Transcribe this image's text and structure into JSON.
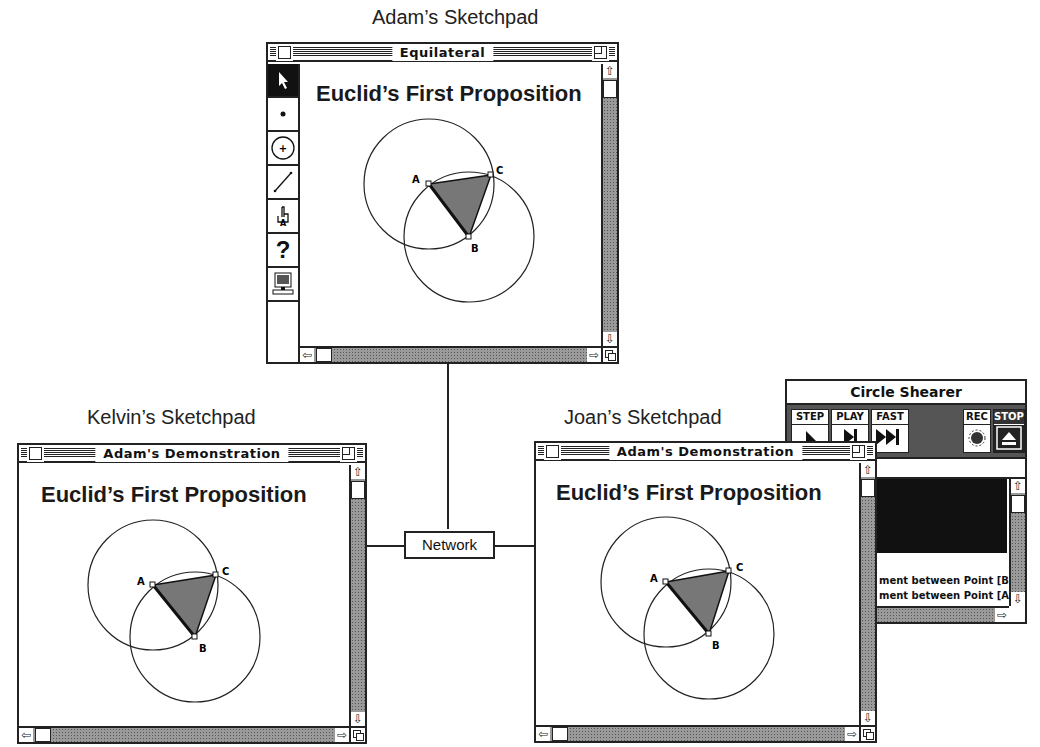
{
  "captions": {
    "adam": "Adam’s Sketchpad",
    "kelvin": "Kelvin’s Sketchpad",
    "joan": "Joan’s Sketchpad"
  },
  "network": {
    "label": "Network"
  },
  "adam_window": {
    "title": "Equilateral",
    "doc_title": "Euclid’s First Proposition",
    "tools": [
      "arrow-select-tool",
      "point-tool",
      "compass-tool",
      "straightedge-tool",
      "text-hand-tool",
      "help-tool",
      "script-tool"
    ]
  },
  "kelvin_window": {
    "title": "Adam's Demonstration",
    "doc_title": "Euclid’s First Proposition"
  },
  "joan_window": {
    "title": "Adam's Demonstration",
    "doc_title": "Euclid’s First Proposition"
  },
  "construction": {
    "points": {
      "A": "A",
      "B": "B",
      "C": "C"
    }
  },
  "script_window": {
    "title": "Circle Shearer",
    "buttons": {
      "step": "STEP",
      "play": "PLAY",
      "fast": "FAST",
      "rec": "REC",
      "stop": "STOP"
    },
    "log_lines": [
      "ment between Point [B",
      "ment between Point [A"
    ]
  },
  "scroll_icons": {
    "up": "⇧",
    "down": "⇩",
    "left": "⇦",
    "right": "⇨"
  }
}
